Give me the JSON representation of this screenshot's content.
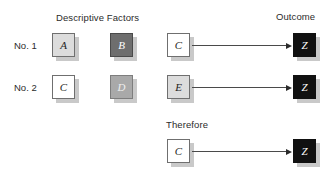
{
  "headings": {
    "descriptive_factors": "Descriptive Factors",
    "outcome": "Outcome",
    "therefore": "Therefore"
  },
  "row_labels": {
    "row1": "No. 1",
    "row2": "No. 2"
  },
  "nodes": {
    "row1": [
      {
        "label": "A",
        "style": "light"
      },
      {
        "label": "B",
        "style": "dark"
      },
      {
        "label": "C",
        "style": "white"
      },
      {
        "label": "Z",
        "style": "black"
      }
    ],
    "row2": [
      {
        "label": "C",
        "style": "white"
      },
      {
        "label": "D",
        "style": "mid"
      },
      {
        "label": "E",
        "style": "light"
      },
      {
        "label": "Z",
        "style": "black"
      }
    ],
    "conclusion": [
      {
        "label": "C",
        "style": "white"
      },
      {
        "label": "Z",
        "style": "black"
      }
    ]
  },
  "colors": {
    "light_gray": "#dcdcdc",
    "dark_gray": "#6e6e6e",
    "mid_gray": "#a9a9a9",
    "black": "#111111",
    "white": "#ffffff",
    "border": "#6f6f6f",
    "shadow": "#c9c9c9",
    "arrow": "#4a4a4a",
    "text": "#2b2b2b"
  }
}
